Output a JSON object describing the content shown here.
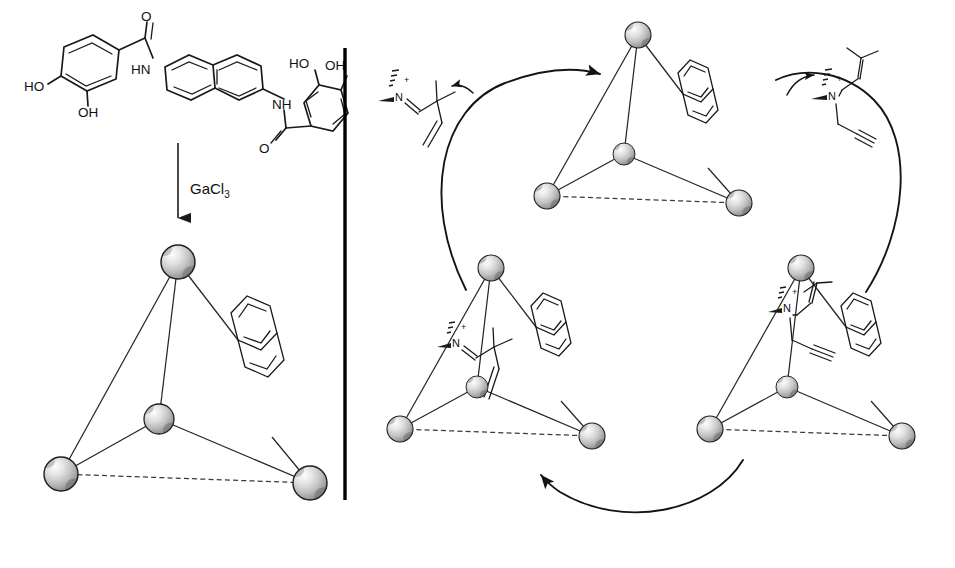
{
  "figure": {
    "kind": "chemical-reaction-scheme",
    "background_color": "#ffffff",
    "ink_color": "#1a1a1a",
    "panels": [
      "self-assembly",
      "catalytic-cycle"
    ],
    "divider": {
      "name": "vertical-rule",
      "x": 345,
      "y_top": 48,
      "y_bottom": 500,
      "color": "#000000"
    }
  },
  "left_panel": {
    "ligand": {
      "name": "bis-catecholamide naphthalene ligand",
      "labels": {
        "left_hydroxyl_meta": "HO",
        "left_hydroxyl_ortho": "OH",
        "left_carbonyl_oxygen": "O",
        "left_amide": "HN",
        "right_amide": "NH",
        "right_carbonyl_oxygen": "O",
        "right_hydroxyl_ortho": "HO",
        "right_hydroxyl_meta": "OH"
      }
    },
    "reaction_arrow": {
      "name": "self-assembly-arrow",
      "reagent": "GaCl",
      "reagent_subscript": "3",
      "direction": "down"
    },
    "assembly": {
      "name": "Ga4L6 tetrahedral cage",
      "vertex_count": 4,
      "vertex_label": "Ga",
      "edge_count": 6,
      "linker": "naphthalene",
      "guest": null
    }
  },
  "cycle": {
    "name": "catalytic-cycle",
    "direction": "counterclockwise",
    "nodes": [
      {
        "id": "empty-cage",
        "position": "top",
        "name": "empty host cage",
        "guest": null,
        "linker": "naphthalene"
      },
      {
        "id": "substrate-bound-cage",
        "position": "bottom-left",
        "name": "host with bound enammonium substrate",
        "guest": "enammonium-substrate",
        "linker": "naphthalene"
      },
      {
        "id": "product-bound-cage",
        "position": "bottom-right",
        "name": "host with bound iminium product",
        "guest": "iminium-product",
        "linker": "naphthalene"
      }
    ],
    "arcs": [
      {
        "id": "arc-top-left",
        "name": "substrate-binding-arc",
        "from": "empty-cage",
        "to": "substrate-bound-cage",
        "arrowhead": "at-top-right"
      },
      {
        "id": "arc-bottom",
        "name": "rearrangement-arc",
        "from": "product-bound-cage",
        "to": "substrate-bound-cage",
        "arrowhead": "at-left"
      },
      {
        "id": "arc-right",
        "name": "product-release-arc",
        "from": "product-bound-cage",
        "to": "empty-cage",
        "arrowhead": "at-top"
      }
    ],
    "substrate": {
      "name": "enammonium substrate",
      "location": "upper-left, outside cycle",
      "labels": {
        "nitrogen": "N",
        "charge": "+"
      },
      "features": [
        "N-methyl wedge",
        "C=N double bond",
        "gem-dimethyl quaternary carbon",
        "terminal vinyl group"
      ],
      "entry_arrow": {
        "name": "substrate-entry-arrow",
        "direction": "left"
      }
    },
    "product": {
      "name": "iminium product",
      "location": "upper-right, outside cycle",
      "labels": {
        "nitrogen": "N",
        "charge": "+"
      },
      "features": [
        "N-methyl wedge",
        "prenyl (2-methyl-2-butenyl) group",
        "propargyl group with terminal alkyne"
      ],
      "exit_arrow": {
        "name": "product-release-arrow",
        "direction": "up-right"
      }
    }
  },
  "cages": {
    "left_large": {
      "name": "cage-large",
      "vertices": [
        {
          "name": "apex-vertex",
          "cx": 178,
          "cy": 262,
          "r": 17
        },
        {
          "name": "center-vertex",
          "cx": 159,
          "cy": 419,
          "r": 15
        },
        {
          "name": "left-vertex",
          "cx": 61,
          "cy": 474,
          "r": 17
        },
        {
          "name": "right-vertex",
          "cx": 310,
          "cy": 483,
          "r": 17
        }
      ],
      "hidden_edge": "left-vertex to right-vertex"
    },
    "top_small": {
      "name": "cage-top",
      "vertices": [
        {
          "name": "apex-vertex",
          "cx": 638,
          "cy": 35,
          "r": 13
        },
        {
          "name": "center-vertex",
          "cx": 624,
          "cy": 154,
          "r": 11
        },
        {
          "name": "left-vertex",
          "cx": 547,
          "cy": 196,
          "r": 13
        },
        {
          "name": "right-vertex",
          "cx": 739,
          "cy": 203,
          "r": 13
        }
      ],
      "hidden_edge": "left-vertex to right-vertex"
    },
    "bottom_left_small": {
      "name": "cage-bottom-left",
      "vertices": [
        {
          "name": "apex-vertex",
          "cx": 491,
          "cy": 268,
          "r": 13
        },
        {
          "name": "center-vertex",
          "cx": 477,
          "cy": 387,
          "r": 11
        },
        {
          "name": "left-vertex",
          "cx": 400,
          "cy": 429,
          "r": 13
        },
        {
          "name": "right-vertex",
          "cx": 592,
          "cy": 436,
          "r": 13
        }
      ],
      "hidden_edge": "left-vertex to right-vertex"
    },
    "bottom_right_small": {
      "name": "cage-bottom-right",
      "vertices": [
        {
          "name": "apex-vertex",
          "cx": 801,
          "cy": 268,
          "r": 13
        },
        {
          "name": "center-vertex",
          "cx": 787,
          "cy": 387,
          "r": 11
        },
        {
          "name": "left-vertex",
          "cx": 710,
          "cy": 429,
          "r": 13
        },
        {
          "name": "right-vertex",
          "cx": 902,
          "cy": 436,
          "r": 13
        }
      ],
      "hidden_edge": "left-vertex to right-vertex"
    }
  }
}
